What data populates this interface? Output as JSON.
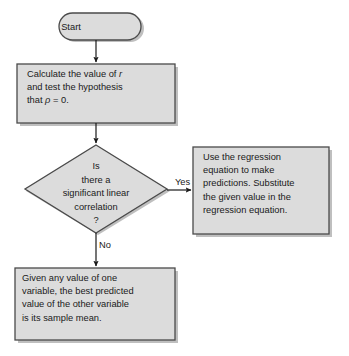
{
  "diagram": {
    "type": "flowchart",
    "colors": {
      "node_fill": "#dcdcdc",
      "node_border": "#4a4a4a",
      "shadow": "#bfbfbf",
      "text": "#1a1a1a",
      "connector": "#1a1a1a",
      "background": "#ffffff"
    },
    "nodes": {
      "start": {
        "shape": "stadium",
        "label": "Start"
      },
      "calculate": {
        "shape": "rectangle",
        "label": "Calculate the value of r\nand test the hypothesis\nthat ρ = 0.",
        "line1": "Calculate the value of ",
        "line1_italic": "r",
        "line2": "and test the hypothesis",
        "line3_pre": "that  ",
        "line3_italic": "ρ",
        "line3_post": " = 0."
      },
      "decision": {
        "shape": "diamond",
        "label": "Is\nthere a\nsignificant linear\ncorrelation\n?"
      },
      "regression": {
        "shape": "rectangle",
        "label": "Use the regression\nequation to make\npredictions. Substitute\nthe given value in the\nregression equation."
      },
      "sample_mean": {
        "shape": "rectangle",
        "label": "Given any value of one\nvariable, the best predicted\nvalue of the other variable\nis its sample mean."
      }
    },
    "edges": {
      "start_to_calculate": {
        "label": ""
      },
      "calculate_to_decision": {
        "label": ""
      },
      "decision_yes": {
        "label": "Yes"
      },
      "decision_no": {
        "label": "No"
      }
    }
  }
}
